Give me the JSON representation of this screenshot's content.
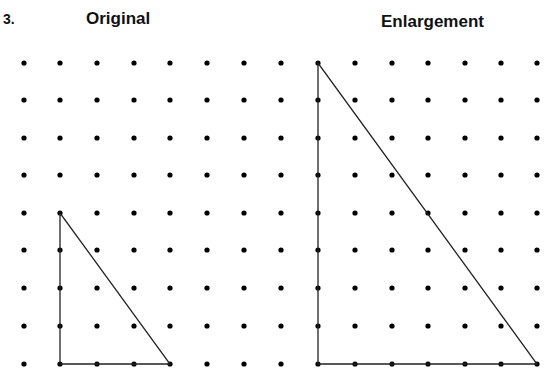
{
  "question_number": "3.",
  "titles": {
    "original": "Original",
    "enlargement": "Enlargement"
  },
  "grid": {
    "columns_x": [
      24,
      60,
      97,
      134,
      170,
      207,
      244,
      281,
      318,
      355,
      392,
      428,
      465,
      501,
      537
    ],
    "rows_y": [
      63,
      100,
      138,
      175,
      213,
      250,
      288,
      326,
      364
    ],
    "dot_radius": 2.6,
    "dot_color": "#000000"
  },
  "shapes": {
    "original_triangle": {
      "points": [
        [
          60,
          213
        ],
        [
          60,
          364
        ],
        [
          170,
          364
        ]
      ],
      "grid_units": {
        "height": 4,
        "base": 3
      }
    },
    "enlarged_triangle": {
      "points": [
        [
          318,
          63
        ],
        [
          318,
          364
        ],
        [
          537,
          364
        ]
      ],
      "grid_units": {
        "height": 8,
        "base": 6
      }
    },
    "stroke_color": "#222222"
  }
}
